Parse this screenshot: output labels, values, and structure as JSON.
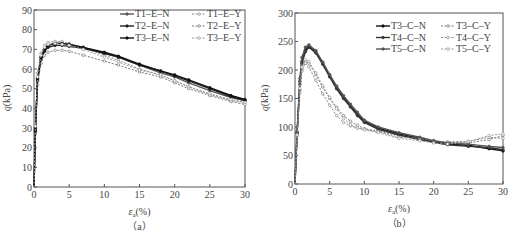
{
  "chart_data": [
    {
      "id": "a",
      "type": "line",
      "caption": "（a）",
      "xlabel": "ε_a(%)",
      "xlabel_main": "ε",
      "xlabel_sub": "a",
      "xlabel_unit": "(%)",
      "ylabel": "q(kPa)",
      "xlim": [
        0,
        30
      ],
      "ylim": [
        0,
        90
      ],
      "xticks": [
        0,
        5,
        10,
        15,
        20,
        25,
        30
      ],
      "yticks": [
        0,
        10,
        20,
        30,
        40,
        50,
        60,
        70,
        80,
        90
      ],
      "grid": false,
      "legend_position": "upper right",
      "series": [
        {
          "name": "T1-E-N",
          "style": "solid",
          "color": "#555555",
          "x": [
            0,
            0.2,
            0.5,
            1,
            1.5,
            2,
            3,
            4,
            5,
            7,
            10,
            12,
            15,
            18,
            20,
            22,
            25,
            28,
            30
          ],
          "y": [
            0,
            30,
            55,
            66,
            70,
            72,
            73,
            73,
            72.5,
            71,
            68,
            66,
            62,
            58,
            56,
            53,
            49,
            45.5,
            44
          ]
        },
        {
          "name": "T1-E-Y",
          "style": "dashed",
          "color": "#888888",
          "x": [
            0,
            0.2,
            0.5,
            1,
            1.5,
            2,
            3,
            4,
            5,
            7,
            10,
            12,
            15,
            18,
            20,
            22,
            25,
            28,
            30
          ],
          "y": [
            0,
            32,
            58,
            68,
            72,
            73.5,
            74,
            74,
            73,
            71,
            67,
            64.5,
            60,
            57,
            54,
            51,
            47,
            44,
            43
          ]
        },
        {
          "name": "T2-E-N",
          "style": "solid",
          "color": "#222222",
          "x": [
            0,
            0.2,
            0.5,
            1,
            1.5,
            2,
            3,
            4,
            5,
            7,
            10,
            12,
            15,
            18,
            20,
            22,
            25,
            28,
            30
          ],
          "y": [
            0,
            28,
            54,
            65,
            69,
            71,
            72,
            72,
            71.5,
            70.5,
            68,
            66,
            62,
            59,
            56.5,
            54,
            50,
            46,
            44
          ]
        },
        {
          "name": "T2-E-Y",
          "style": "dashed",
          "color": "#777777",
          "x": [
            0,
            0.2,
            0.5,
            1,
            1.5,
            2,
            3,
            4,
            5,
            7,
            10,
            12,
            15,
            18,
            20,
            22,
            25,
            28,
            30
          ],
          "y": [
            0,
            27,
            52,
            63,
            67,
            68.5,
            69.5,
            69.5,
            69,
            67,
            64,
            62,
            58.5,
            56,
            53,
            50,
            46.5,
            43.5,
            42
          ]
        },
        {
          "name": "T3-E-N",
          "style": "solid",
          "color": "#111111",
          "x": [
            0,
            0.2,
            0.5,
            1,
            1.5,
            2,
            3,
            4,
            5,
            7,
            10,
            12,
            15,
            18,
            20,
            22,
            25,
            28,
            30
          ],
          "y": [
            0,
            29,
            55,
            66,
            70,
            72,
            73,
            73,
            72.5,
            71,
            68.5,
            66.5,
            62.5,
            59,
            57,
            54.5,
            50.5,
            46.5,
            44.5
          ]
        },
        {
          "name": "T3-E-Y",
          "style": "dashed",
          "color": "#999999",
          "x": [
            0,
            0.2,
            0.5,
            1,
            1.5,
            2,
            3,
            4,
            5,
            7,
            10,
            12,
            15,
            18,
            20,
            22,
            25,
            28,
            30
          ],
          "y": [
            0,
            31,
            56,
            67,
            71,
            72.5,
            73,
            72.5,
            72,
            70,
            66,
            63.5,
            59.5,
            57,
            54,
            51,
            47.5,
            44.5,
            43
          ]
        }
      ]
    },
    {
      "id": "b",
      "type": "line",
      "caption": "（b）",
      "xlabel": "ε_a(%)",
      "xlabel_main": "ε",
      "xlabel_sub": "a",
      "xlabel_unit": "(%)",
      "ylabel": "q(kPa)",
      "xlim": [
        0,
        30
      ],
      "ylim": [
        0,
        300
      ],
      "xticks": [
        0,
        5,
        10,
        15,
        20,
        25,
        30
      ],
      "yticks": [
        0,
        50,
        100,
        150,
        200,
        250,
        300
      ],
      "grid": false,
      "legend_position": "upper right",
      "series": [
        {
          "name": "T3-C-N",
          "style": "solid",
          "color": "#111111",
          "x": [
            0,
            0.3,
            0.7,
            1,
            1.5,
            2,
            3,
            4,
            5,
            6,
            7,
            8,
            9,
            10,
            12,
            15,
            18,
            20,
            22,
            25,
            28,
            30
          ],
          "y": [
            0,
            90,
            180,
            215,
            235,
            242,
            232,
            212,
            190,
            170,
            152,
            137,
            122,
            110,
            98,
            88,
            80,
            74,
            70,
            68,
            62,
            58
          ]
        },
        {
          "name": "T3-C-Y",
          "style": "dashed",
          "color": "#777777",
          "x": [
            0,
            0.3,
            0.7,
            1,
            1.5,
            2,
            3,
            4,
            5,
            6,
            7,
            8,
            9,
            10,
            12,
            15,
            18,
            20,
            22,
            25,
            28,
            30
          ],
          "y": [
            0,
            85,
            165,
            200,
            215,
            212,
            192,
            170,
            150,
            135,
            120,
            110,
            103,
            97,
            93,
            85,
            78,
            76,
            73,
            72,
            78,
            85
          ]
        },
        {
          "name": "T4-C-N",
          "style": "solid",
          "color": "#333333",
          "x": [
            0,
            0.3,
            0.7,
            1,
            1.5,
            2,
            3,
            4,
            5,
            6,
            7,
            8,
            9,
            10,
            12,
            15,
            18,
            20,
            22,
            25,
            28,
            30
          ],
          "y": [
            0,
            88,
            175,
            212,
            232,
            240,
            230,
            210,
            188,
            167,
            150,
            135,
            120,
            108,
            96,
            86,
            78,
            73,
            69,
            66,
            64,
            60
          ]
        },
        {
          "name": "T4-C-Y",
          "style": "dashed",
          "color": "#888888",
          "x": [
            0,
            0.3,
            0.7,
            1,
            1.5,
            2,
            3,
            4,
            5,
            6,
            7,
            8,
            9,
            10,
            12,
            15,
            18,
            20,
            22,
            25,
            28,
            30
          ],
          "y": [
            0,
            84,
            160,
            198,
            212,
            205,
            182,
            158,
            138,
            120,
            108,
            102,
            98,
            96,
            92,
            82,
            80,
            75,
            74,
            75,
            82,
            80
          ]
        },
        {
          "name": "T5-C-N",
          "style": "solid",
          "color": "#555555",
          "x": [
            0,
            0.3,
            0.7,
            1,
            1.5,
            2,
            3,
            4,
            5,
            6,
            7,
            8,
            9,
            10,
            12,
            15,
            18,
            20,
            22,
            25,
            28,
            30
          ],
          "y": [
            0,
            92,
            185,
            222,
            240,
            244,
            234,
            214,
            192,
            172,
            155,
            140,
            126,
            112,
            100,
            90,
            82,
            76,
            72,
            70,
            66,
            64
          ]
        },
        {
          "name": "T5-C-Y",
          "style": "dashed",
          "color": "#999999",
          "x": [
            0,
            0.3,
            0.7,
            1,
            1.5,
            2,
            3,
            4,
            5,
            6,
            7,
            8,
            9,
            10,
            12,
            15,
            18,
            20,
            22,
            25,
            28,
            30
          ],
          "y": [
            0,
            86,
            168,
            205,
            218,
            215,
            195,
            172,
            152,
            132,
            115,
            104,
            98,
            95,
            90,
            80,
            76,
            72,
            70,
            74,
            85,
            88
          ]
        }
      ]
    }
  ]
}
